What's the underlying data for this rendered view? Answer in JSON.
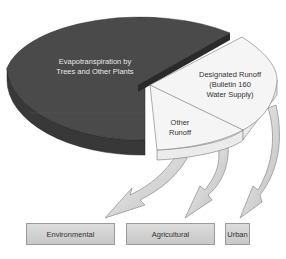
{
  "diagram": {
    "type": "exploded-pie-with-flow",
    "slices": [
      {
        "label": "Evapotranspiration by Trees and Other Plants",
        "line1": "Evapotranspiration by",
        "line2": "Trees and Other Plants",
        "color": "#4a4a4a"
      },
      {
        "label": "Designated Runoff (Bulletin 160 Water Supply)",
        "line1": "Designated Runoff",
        "line2": "(Bulletin 160",
        "line3": "Water Supply)",
        "color": "#f4f4f4"
      },
      {
        "label": "Other Runoff",
        "line1": "Other",
        "line2": "Runoff",
        "color": "#f4f4f4"
      }
    ],
    "destinations": [
      {
        "label": "Environmental"
      },
      {
        "label": "Agricultural"
      },
      {
        "label": "Urban"
      }
    ],
    "colors": {
      "dark_top": "#4a4a4a",
      "dark_side": "#3a3a3a",
      "light_top": "#f5f5f5",
      "light_side": "#ececec",
      "arrow": "#d0d0d0",
      "outline": "#777777"
    }
  }
}
